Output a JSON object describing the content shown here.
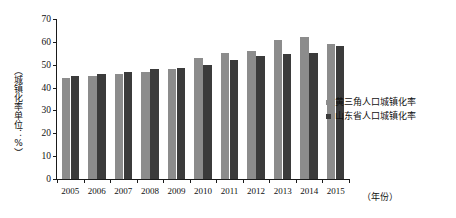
{
  "chart_data": {
    "type": "bar",
    "title": "",
    "xlabel": "（年份）",
    "ylabel": "（城镇化率单位：%）",
    "categories": [
      "2005",
      "2006",
      "2007",
      "2008",
      "2009",
      "2010",
      "2011",
      "2012",
      "2013",
      "2014",
      "2015"
    ],
    "series": [
      {
        "name": "黄三角人口城镇化率",
        "color": "#8c8c8c",
        "values": [
          44,
          45,
          46,
          47,
          48,
          53,
          55,
          56,
          61,
          62,
          59
        ]
      },
      {
        "name": "山东省人口城镇化率",
        "color": "#3b3b3b",
        "values": [
          45,
          46,
          47,
          48,
          48.5,
          50,
          52,
          54,
          54.5,
          55,
          58
        ]
      }
    ],
    "ylim": [
      0,
      70
    ],
    "ytick_labels": [
      "0",
      "10",
      "20",
      "30",
      "40",
      "50",
      "60",
      "70"
    ],
    "ytick_values": [
      0,
      10,
      20,
      30,
      40,
      50,
      60,
      70
    ],
    "grid": false,
    "legend_position": "right-middle"
  },
  "axes": {
    "y_axis_title": "（城镇化率单位：%）",
    "x_axis_unit": "（年份）"
  },
  "legend": {
    "items": [
      {
        "label": "黄三角人口城镇化率",
        "color": "#8c8c8c"
      },
      {
        "label": "山东省人口城镇化率",
        "color": "#3b3b3b"
      }
    ]
  },
  "colors": {
    "series_a": "#8c8c8c",
    "series_b": "#3b3b3b",
    "axis": "#1a1a1a",
    "background": "#ffffff"
  }
}
